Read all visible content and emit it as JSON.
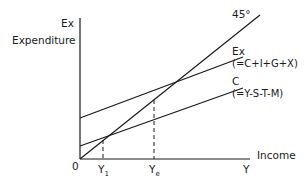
{
  "diagram": {
    "type": "macroeconomic-equilibrium-diagram",
    "y_axis": {
      "label_short": "Ex",
      "label_long": "Expenditure"
    },
    "x_axis": {
      "label_short": "Y",
      "label_long": "Income"
    },
    "origin_label": "0",
    "lines": [
      {
        "id": "45deg",
        "label": "45°",
        "formula": ""
      },
      {
        "id": "ex",
        "label": "Ex",
        "formula": "(=C+I+G+X)"
      },
      {
        "id": "c",
        "label": "C",
        "formula": "(=Y-S-T-M)"
      }
    ],
    "x_markers": [
      {
        "id": "y1",
        "label": "Y",
        "subscript": "1"
      },
      {
        "id": "ye",
        "label": "Y",
        "subscript": "e"
      }
    ],
    "colors": {
      "line": "#1a1a1a",
      "background": "#ffffff"
    }
  }
}
